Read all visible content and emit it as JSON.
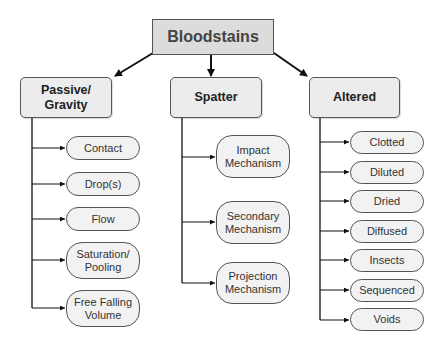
{
  "diagram": {
    "root": {
      "label": "Bloodstains"
    },
    "categories": [
      {
        "label": "Passive/\nGravity",
        "line1": "Passive/",
        "line2": "Gravity",
        "children": [
          {
            "line1": "Contact"
          },
          {
            "line1": "Drop(s)"
          },
          {
            "line1": "Flow"
          },
          {
            "line1": "Saturation/",
            "line2": "Pooling"
          },
          {
            "line1": "Free Falling",
            "line2": "Volume"
          }
        ]
      },
      {
        "label": "Spatter",
        "line1": "Spatter",
        "children": [
          {
            "line1": "Impact",
            "line2": "Mechanism"
          },
          {
            "line1": "Secondary",
            "line2": "Mechanism"
          },
          {
            "line1": "Projection",
            "line2": "Mechanism"
          }
        ]
      },
      {
        "label": "Altered",
        "line1": "Altered",
        "children": [
          {
            "line1": "Clotted"
          },
          {
            "line1": "Diluted"
          },
          {
            "line1": "Dried"
          },
          {
            "line1": "Diffused"
          },
          {
            "line1": "Insects"
          },
          {
            "line1": "Sequenced"
          },
          {
            "line1": "Voids"
          }
        ]
      }
    ],
    "colors": {
      "root_fill": "#dcdcdc",
      "category_fill": "#ececec",
      "leaf_fill": "#f2f2f2",
      "stroke": "#555555",
      "arrow": "#111111"
    }
  }
}
